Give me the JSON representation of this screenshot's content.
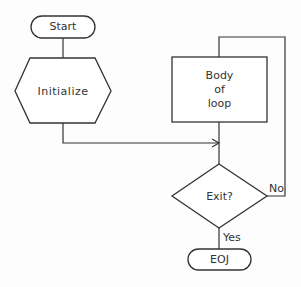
{
  "diagram": {
    "type": "flowchart",
    "nodes": [
      {
        "id": "start",
        "shape": "terminator",
        "label": "Start"
      },
      {
        "id": "init",
        "shape": "hexagon",
        "label": "Initialize"
      },
      {
        "id": "body",
        "shape": "rectangle",
        "label_lines": [
          "Body",
          "of",
          "loop"
        ]
      },
      {
        "id": "exit",
        "shape": "diamond",
        "label": "Exit?"
      },
      {
        "id": "eoj",
        "shape": "terminator",
        "label": "EOJ"
      }
    ],
    "edges": [
      {
        "from": "start",
        "to": "init",
        "label": ""
      },
      {
        "from": "init",
        "to": "exit",
        "label": "",
        "arrow": true
      },
      {
        "from": "body",
        "to": "exit",
        "label": ""
      },
      {
        "from": "exit",
        "to": "body",
        "label": "No"
      },
      {
        "from": "exit",
        "to": "eoj",
        "label": "Yes"
      }
    ],
    "stroke_color": "#333333",
    "fill_color": "#ffffff"
  }
}
